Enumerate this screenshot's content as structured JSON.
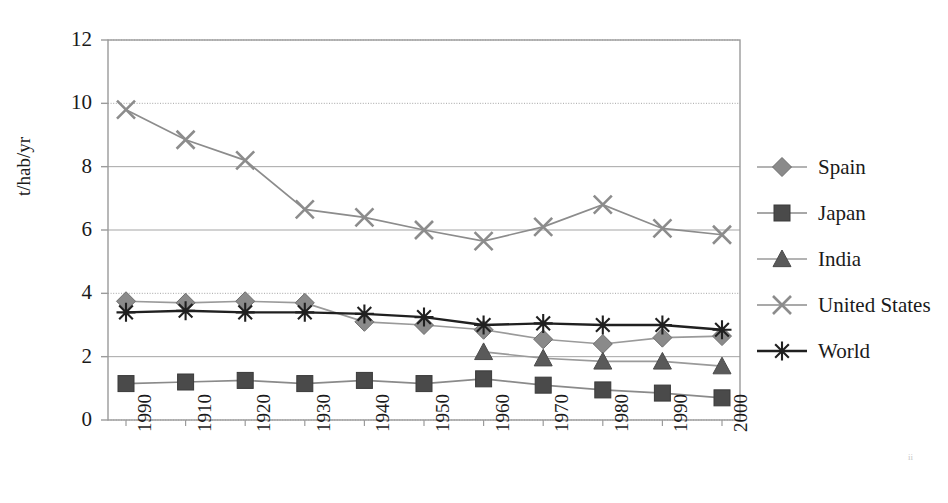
{
  "chart_data": {
    "type": "line",
    "title": "",
    "xlabel": "",
    "ylabel": "t/hab/yr",
    "x": [
      "1990",
      "1910",
      "1920",
      "1930",
      "1940",
      "1950",
      "1960",
      "1970",
      "1980",
      "1990",
      "2000"
    ],
    "categories": [
      "1990",
      "1910",
      "1920",
      "1930",
      "1940",
      "1950",
      "1960",
      "1970",
      "1980",
      "1990",
      "2000"
    ],
    "ylim": [
      0,
      12
    ],
    "yticks": [
      0,
      2,
      4,
      6,
      8,
      10,
      12
    ],
    "ytick_labels": [
      "0",
      "2",
      "4",
      "6",
      "8",
      "10",
      "12"
    ],
    "grid": true,
    "grid_axis": "y",
    "legend_position": "right",
    "series": [
      {
        "name": "Spain",
        "marker": "diamond",
        "color": "#8a8a8a",
        "line_color": "#9a9a9a",
        "values": [
          3.75,
          3.7,
          3.75,
          3.7,
          3.1,
          3.0,
          2.85,
          2.55,
          2.4,
          2.6,
          2.65
        ]
      },
      {
        "name": "Japan",
        "marker": "square",
        "color": "#4a4a4a",
        "line_color": "#8a8a8a",
        "values": [
          1.15,
          1.2,
          1.25,
          1.15,
          1.25,
          1.15,
          1.3,
          1.1,
          0.95,
          0.85,
          0.7
        ]
      },
      {
        "name": "India",
        "marker": "triangle",
        "color": "#5a5a5a",
        "line_color": "#9a9a9a",
        "values": [
          null,
          null,
          null,
          null,
          null,
          null,
          2.15,
          1.95,
          1.85,
          1.85,
          1.7
        ]
      },
      {
        "name": "United States",
        "marker": "cross",
        "color": "#8c8c8c",
        "line_color": "#8c8c8c",
        "values": [
          9.8,
          8.85,
          8.2,
          6.65,
          6.4,
          6.0,
          5.65,
          6.1,
          6.8,
          6.05,
          5.85
        ]
      },
      {
        "name": "World",
        "marker": "asterisk",
        "color": "#202020",
        "line_color": "#202020",
        "values": [
          3.4,
          3.45,
          3.4,
          3.4,
          3.35,
          3.25,
          3.0,
          3.05,
          3.0,
          3.0,
          2.85
        ]
      }
    ]
  },
  "axes": {
    "y_title": "t/hab/yr"
  },
  "legend": {
    "items": [
      {
        "label": "Spain"
      },
      {
        "label": "Japan"
      },
      {
        "label": "India"
      },
      {
        "label": "United States"
      },
      {
        "label": "World"
      }
    ]
  },
  "artifacts": {
    "corner_smudge": "ii"
  }
}
